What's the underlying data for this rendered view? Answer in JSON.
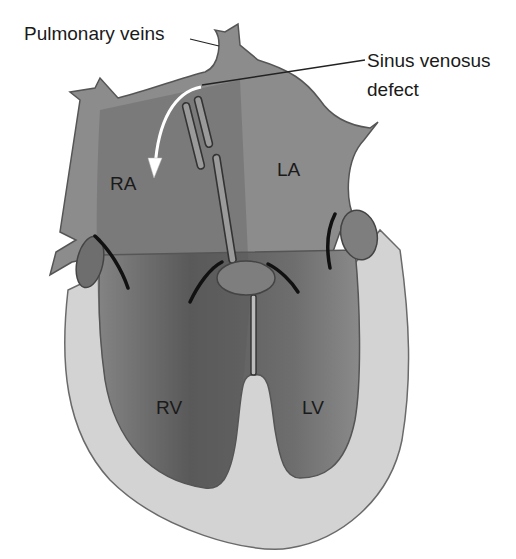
{
  "diagram": {
    "callouts": {
      "pulmonary_veins": "Pulmonary veins",
      "sinus_venosus_line1": "Sinus venosus",
      "sinus_venosus_line2": "defect"
    },
    "chambers": {
      "ra": "RA",
      "la": "LA",
      "rv": "RV",
      "lv": "LV"
    },
    "colors": {
      "background": "#ffffff",
      "chamber_fill": "#8c8c8c",
      "chamber_dark": "#5e5e5e",
      "myocardium": "#d2d2d2",
      "outline": "#555555",
      "valve_fill": "#7a7a7a",
      "text": "#1a1a1a",
      "arrow": "#ffffff"
    },
    "arrow": {
      "description": "white curved arrow from defect into RA"
    }
  }
}
